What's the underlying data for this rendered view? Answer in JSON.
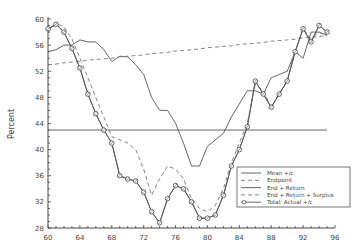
{
  "chart_data": {
    "type": "line",
    "title": "",
    "xlabel": "",
    "ylabel": "Percent",
    "xlim": [
      60,
      96
    ],
    "ylim": [
      28,
      60
    ],
    "x_ticks": [
      60,
      64,
      68,
      72,
      76,
      80,
      84,
      88,
      92,
      96
    ],
    "y_ticks": [
      28,
      32,
      36,
      40,
      44,
      48,
      52,
      56,
      60
    ],
    "grid": false,
    "legend_position": "lower right",
    "reference_line": {
      "y": 43
    },
    "x": [
      60,
      61,
      62,
      63,
      64,
      65,
      66,
      67,
      68,
      69,
      70,
      71,
      72,
      73,
      74,
      75,
      76,
      77,
      78,
      79,
      80,
      81,
      82,
      83,
      84,
      85,
      86,
      87,
      88,
      89,
      90,
      91,
      92,
      93,
      94,
      95
    ],
    "series": [
      {
        "name": "Mean +/c",
        "style": "solid",
        "values": [
          55,
          55.3,
          56,
          56,
          56.8,
          56.5,
          56.5,
          55.3,
          53.5,
          54.3,
          54.2,
          53,
          51.5,
          48,
          46,
          46,
          44,
          41,
          37.5,
          37.5,
          40.5,
          41.5,
          42.5,
          45,
          47,
          49,
          49,
          48.5,
          51,
          51.5,
          52,
          55,
          54,
          58,
          58,
          57.5
        ]
      },
      {
        "name": "Endpoint",
        "style": "dashed",
        "values": [
          53,
          53.1,
          53.3,
          53.4,
          53.5,
          53.7,
          53.8,
          53.9,
          54.0,
          54.2,
          54.3,
          54.4,
          54.5,
          54.7,
          54.8,
          54.9,
          55.1,
          55.2,
          55.3,
          55.4,
          55.6,
          55.7,
          55.8,
          55.9,
          56.1,
          56.2,
          56.3,
          56.4,
          56.6,
          56.7,
          56.8,
          56.9,
          57.1,
          57.2,
          57.3,
          57.5
        ]
      },
      {
        "name": "End + Return",
        "style": "solid",
        "values": [
          58.3,
          59.2,
          58,
          55.5,
          52.5,
          48.5,
          45.5,
          43,
          41,
          36,
          35.5,
          35.2,
          33.5,
          30.5,
          28.8,
          32.5,
          34.5,
          34,
          32,
          29.5,
          29.5,
          30,
          33,
          37.5,
          40,
          43.5,
          50.5,
          48.5,
          46.5,
          48.5,
          50.5,
          55,
          58.5,
          56.5,
          59,
          58
        ]
      },
      {
        "name": "End + Return + Surplus",
        "style": "dashed",
        "values": [
          58,
          59.3,
          58.8,
          57,
          54,
          51,
          48,
          45,
          42,
          41.5,
          41,
          40,
          37,
          33,
          35.5,
          37.5,
          37,
          35.5,
          32.5,
          31,
          30.5,
          31.5,
          34,
          38,
          41,
          44,
          50,
          49,
          46.5,
          48.5,
          50.5,
          55,
          58.5,
          57,
          58,
          57.5
        ]
      },
      {
        "name": "Total: Actual +/c",
        "style": "solid-markers",
        "values": [
          58.5,
          59.2,
          58,
          55.5,
          52.5,
          48.5,
          45.5,
          43,
          41,
          36,
          35.5,
          35.2,
          33.5,
          30.5,
          28.8,
          32.5,
          34.5,
          34,
          32,
          29.5,
          29.5,
          30,
          33,
          37.5,
          40,
          43.5,
          50.5,
          48.5,
          46.5,
          48.5,
          50.5,
          55,
          58.5,
          56.5,
          59,
          58
        ]
      }
    ]
  },
  "colors": {
    "axis": "#444444",
    "line": "#555555",
    "dashed": "#777777"
  }
}
